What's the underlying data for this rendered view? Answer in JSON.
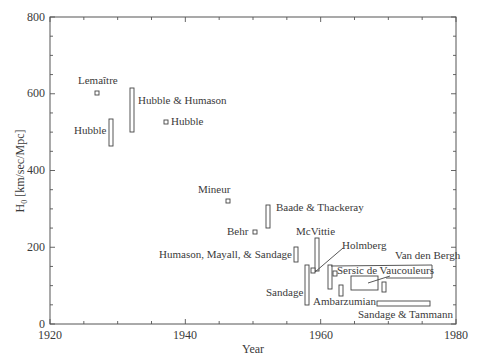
{
  "chart_data": {
    "type": "scatter",
    "title": "",
    "xlabel": "Year",
    "ylabel": "H0 [km/sec/Mpc]",
    "ylabel_main": "H",
    "ylabel_sub": "0",
    "ylabel_rest": " [km/sec/Mpc]",
    "xlim": [
      1920,
      1980
    ],
    "ylim": [
      0,
      800
    ],
    "x_ticks": [
      1920,
      1940,
      1960,
      1980
    ],
    "x_tick_labels": [
      "1920",
      "1940",
      "1960",
      "1980"
    ],
    "x_minor_step": 5,
    "y_ticks": [
      0,
      200,
      400,
      600,
      800
    ],
    "y_tick_labels": [
      "0",
      "200",
      "400",
      "600",
      "800"
    ],
    "y_minor_step": 50,
    "grid": false,
    "legend": null,
    "series": [
      {
        "name": "Lemaître",
        "year": 1927,
        "year_end": 1927,
        "h_low": 600,
        "h_high": 600,
        "kind": "point"
      },
      {
        "name": "Hubble",
        "year": 1929,
        "year_end": 1929,
        "h_low": 465,
        "h_high": 535,
        "kind": "range"
      },
      {
        "name": "Hubble & Humason",
        "year": 1931.5,
        "year_end": 1931.5,
        "h_low": 500,
        "h_high": 615,
        "kind": "range"
      },
      {
        "name": "Hubble",
        "year": 1936,
        "year_end": 1936,
        "h_low": 526,
        "h_high": 526,
        "kind": "point"
      },
      {
        "name": "Mineur",
        "year": 1946,
        "year_end": 1946,
        "h_low": 320,
        "h_high": 320,
        "kind": "point"
      },
      {
        "name": "Baade & Thackeray",
        "year": 1952.5,
        "year_end": 1952.5,
        "h_low": 250,
        "h_high": 310,
        "kind": "range"
      },
      {
        "name": "Behr",
        "year": 1951,
        "year_end": 1951,
        "h_low": 240,
        "h_high": 240,
        "kind": "point"
      },
      {
        "name": "Humason, Mayall, & Sandage",
        "year": 1956,
        "year_end": 1956,
        "h_low": 160,
        "h_high": 200,
        "kind": "range"
      },
      {
        "name": "McVittie",
        "year": 1959,
        "year_end": 1959,
        "h_low": 140,
        "h_high": 225,
        "kind": "range"
      },
      {
        "name": "Sandage",
        "year": 1958,
        "year_end": 1958,
        "h_low": 50,
        "h_high": 155,
        "kind": "range"
      },
      {
        "name": "Holmberg",
        "year": 1958.5,
        "year_end": 1958.5,
        "h_low": 134,
        "h_high": 134,
        "kind": "point"
      },
      {
        "name": "Sersic",
        "year": 1961,
        "year_end": 1961,
        "h_low": 100,
        "h_high": 150,
        "kind": "range"
      },
      {
        "name": "de Vaucouleurs",
        "year": 1961.8,
        "year_end": 1961.8,
        "h_low": 125,
        "h_high": 125,
        "kind": "point"
      },
      {
        "name": "Van den Bergh",
        "year": 1965,
        "year_end": 1975,
        "h_low": 75,
        "h_high": 120,
        "kind": "box"
      },
      {
        "name": "Van den Bergh (extended)",
        "year": 1962,
        "year_end": 1976,
        "h_low": 130,
        "h_high": 155,
        "kind": "box"
      },
      {
        "name": "Ambarzumian",
        "year": 1963,
        "year_end": 1963,
        "h_low": 70,
        "h_high": 100,
        "kind": "range"
      },
      {
        "name": "de Vaucouleurs",
        "year": 1969.5,
        "year_end": 1969.5,
        "h_low": 80,
        "h_high": 110,
        "kind": "range"
      },
      {
        "name": "Sandage & Tammann",
        "year": 1968,
        "year_end": 1976,
        "h_low": 50,
        "h_high": 60,
        "kind": "box"
      }
    ],
    "annotations": [
      {
        "text": "Lemaître"
      },
      {
        "text": "Hubble"
      },
      {
        "text": "Hubble & Humason"
      },
      {
        "text": "Hubble"
      },
      {
        "text": "Mineur"
      },
      {
        "text": "Baade & Thackeray"
      },
      {
        "text": "Behr"
      },
      {
        "text": "McVittie"
      },
      {
        "text": "Humason, Mayall, & Sandage"
      },
      {
        "text": "Holmberg"
      },
      {
        "text": "Van den Bergh"
      },
      {
        "text": "Sersic de Vaucouleurs"
      },
      {
        "text": "Sandage"
      },
      {
        "text": "Ambarzumian"
      },
      {
        "text": "Sandage & Tammann"
      }
    ]
  },
  "colors": {
    "axis": "#555555",
    "marker": "#444444",
    "text": "#3a3a3a",
    "background": "#ffffff"
  }
}
